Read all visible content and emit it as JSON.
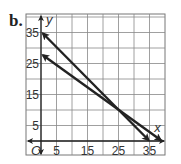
{
  "part_label": "b.",
  "chart_data": {
    "type": "line",
    "title": "",
    "xlabel": "x",
    "ylabel": "y",
    "origin_label": "O",
    "xlim": [
      -5,
      40
    ],
    "ylim": [
      -5,
      40
    ],
    "grid": true,
    "grid_step": 5,
    "x_tick_labels": [
      "5",
      "15",
      "25",
      "35"
    ],
    "x_ticks": [
      5,
      15,
      25,
      35
    ],
    "y_tick_labels": [
      "5",
      "15",
      "25",
      "35"
    ],
    "y_ticks": [
      5,
      15,
      25,
      35
    ],
    "series": [
      {
        "name": "line-1",
        "x": [
          0,
          35
        ],
        "y": [
          35,
          0
        ],
        "arrows": "both"
      },
      {
        "name": "line-2",
        "x": [
          0,
          38.9
        ],
        "y": [
          28,
          0
        ],
        "arrows": "both"
      }
    ],
    "intersection": {
      "x": 25,
      "y": 10
    }
  }
}
